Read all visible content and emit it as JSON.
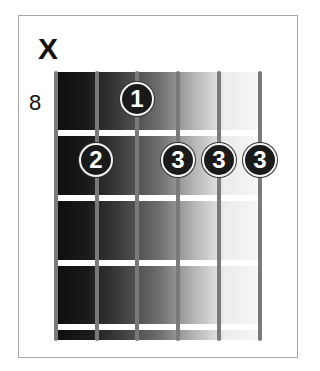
{
  "chord_diagram": {
    "muted_string_marker": "X",
    "muted_string": 6,
    "start_fret": "8",
    "strings": 6,
    "frets_shown": 4,
    "fingers": [
      {
        "string": 4,
        "fret": 1,
        "finger": "1"
      },
      {
        "string": 5,
        "fret": 2,
        "finger": "2"
      },
      {
        "string": 3,
        "fret": 2,
        "finger": "3"
      },
      {
        "string": 2,
        "fret": 2,
        "finger": "3"
      },
      {
        "string": 1,
        "fret": 2,
        "finger": "3"
      }
    ]
  },
  "colors": {
    "fretboard_dark": "#0d0d0d",
    "fretboard_light": "#f7f7f7",
    "string": "#7a7a7a",
    "fret": "#ffffff",
    "dot": "#1a1a1a",
    "frame": "#a8a8a8"
  }
}
